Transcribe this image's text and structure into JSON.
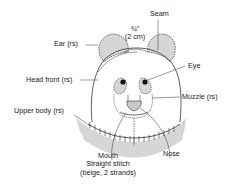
{
  "labels": {
    "seam": "Seam",
    "measure_fraction": "¾\"",
    "measure_metric": "(2 cm)",
    "ear": "Ear (rs)",
    "eye": "Eye",
    "head_front": "Head front (rs)",
    "muzzle": "Muzzle (rs)",
    "upper_body": "Upper body (rs)",
    "nose": "Nose",
    "mouth_line1": "Mouth",
    "mouth_line2": "Straight stitch",
    "mouth_line3": "(beige, 2 strands)"
  },
  "colors": {
    "fill_gray": "#d6d6d6",
    "line": "#333333",
    "eye": "#111111"
  }
}
